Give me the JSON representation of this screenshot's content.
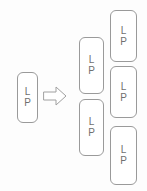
{
  "diagram": {
    "type": "transformation-flow",
    "title": "",
    "background_color": "#fdfdfd",
    "node_border_color": "#9a9a9a",
    "node_fill_color": "#ffffff",
    "node_text_color": "#6f6f6f",
    "arrow_color": "#9a9a9a",
    "node_label_lines": [
      "L",
      "P"
    ],
    "columns": [
      {
        "name": "source",
        "node_count": 1,
        "nodes": [
          {
            "id": "src-1",
            "line1": "L",
            "line2": "P",
            "x": 17,
            "y": 72,
            "width": 21,
            "height": 51
          }
        ]
      },
      {
        "name": "middle",
        "node_count": 2,
        "nodes": [
          {
            "id": "mid-1",
            "line1": "L",
            "line2": "P",
            "x": 79,
            "y": 37,
            "width": 25,
            "height": 57
          },
          {
            "id": "mid-2",
            "line1": "L",
            "line2": "P",
            "x": 79,
            "y": 99,
            "width": 25,
            "height": 57
          }
        ]
      },
      {
        "name": "right",
        "node_count": 3,
        "nodes": [
          {
            "id": "right-1",
            "line1": "L",
            "line2": "P",
            "x": 110,
            "y": 10,
            "width": 27,
            "height": 52
          },
          {
            "id": "right-2",
            "line1": "L",
            "line2": "P",
            "x": 110,
            "y": 66,
            "width": 27,
            "height": 52
          },
          {
            "id": "right-3",
            "line1": "L",
            "line2": "P",
            "x": 110,
            "y": 126,
            "width": 27,
            "height": 59
          }
        ]
      }
    ],
    "arrow": {
      "name": "right-arrow-icon",
      "direction": "right",
      "x": 43,
      "y": 85,
      "width": 24,
      "height": 22
    }
  }
}
